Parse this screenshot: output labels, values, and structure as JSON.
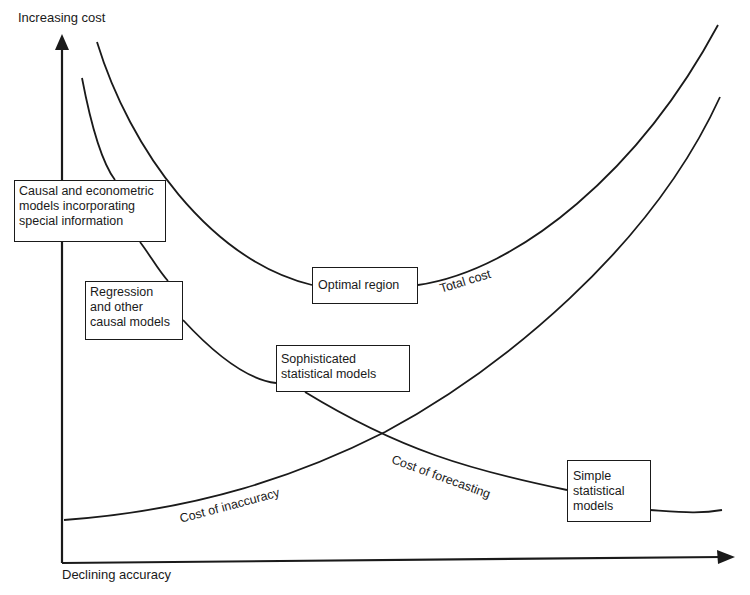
{
  "diagram": {
    "y_axis_label": "Increasing cost",
    "x_axis_label": "Declining accuracy",
    "curves": {
      "total_cost": "Total cost",
      "cost_of_forecasting": "Cost of forecasting",
      "cost_of_inaccuracy": "Cost of inaccuracy"
    },
    "boxes": {
      "causal_econometric": [
        "Causal and econometric",
        "models incorporating",
        "special information"
      ],
      "regression": [
        "Regression",
        "and other",
        "causal models"
      ],
      "optimal_region": [
        "Optimal region"
      ],
      "sophisticated": [
        "Sophisticated",
        "statistical models"
      ],
      "simple": [
        "Simple",
        "statistical",
        "models"
      ]
    },
    "colors": {
      "line": "#1a1a1a",
      "background": "#ffffff"
    }
  }
}
